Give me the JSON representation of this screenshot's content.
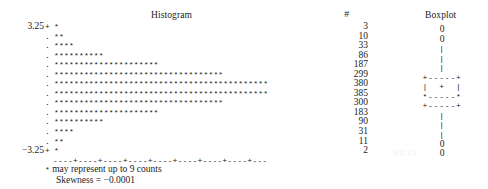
{
  "titles": {
    "histogram": "Histogram",
    "counts": "#",
    "boxplot": "Boxplot"
  },
  "axis": {
    "top_label": "3.25",
    "bottom_label": "−3.25",
    "end_mark": "+",
    "mid_mark": ".",
    "scale_line": "----+----+----+----+----+----+----+----+---"
  },
  "footnotes": {
    "legend_star": "*",
    "legend_text": " may represent up to 9 counts",
    "skewness": "Skewness = −0.0001"
  },
  "chart_data": {
    "type": "bar",
    "title": "Histogram",
    "xlabel": "",
    "ylabel": "",
    "orientation": "horizontal",
    "star_unit": 9,
    "categories": [
      "3.25",
      "",
      "",
      "",
      "",
      "",
      "",
      "",
      "",
      "",
      "",
      "",
      "",
      "-3.25"
    ],
    "counts": [
      3,
      10,
      33,
      86,
      187,
      299,
      380,
      385,
      300,
      183,
      90,
      31,
      11,
      2
    ],
    "stars": [
      "*",
      "**",
      "****",
      "**********",
      "*********************",
      "**********************************",
      "*******************************************",
      "*******************************************",
      "**********************************",
      "*********************",
      "**********",
      "****",
      "**",
      "*"
    ],
    "boxplot_rows": [
      "0",
      "0",
      "|",
      "|",
      "|",
      "+-----+",
      "|  +  |",
      "*-----*",
      "+-----+",
      "|",
      "|",
      "|",
      "0",
      "0"
    ]
  },
  "watermark": "WILEY"
}
